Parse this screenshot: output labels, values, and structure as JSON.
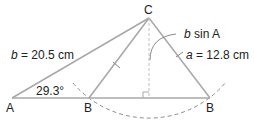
{
  "diagram": {
    "colors": {
      "line": "#a8a8a8",
      "dashed": "#8c8c8c",
      "text": "#222222"
    },
    "vertices": {
      "A": {
        "label": "A",
        "x": 12,
        "y": 98
      },
      "B1": {
        "label": "B",
        "x": 89,
        "y": 98
      },
      "C": {
        "label": "C",
        "x": 149,
        "y": 18
      },
      "B2": {
        "label": "B",
        "x": 210,
        "y": 98
      }
    },
    "labels": {
      "side_b_var": "b",
      "side_b_rest": " = 20.5 cm",
      "side_a_var": "a",
      "side_a_rest": " = 12.8 cm",
      "height_var": "b",
      "height_rest": " sin A",
      "angle_A": "29.3°"
    }
  }
}
